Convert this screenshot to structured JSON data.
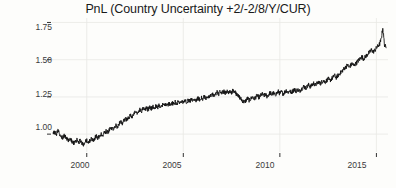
{
  "chart_data": {
    "type": "line",
    "title": "PnL (Country Uncertainty +2/-2/8/Y/CUR)",
    "xlabel": "",
    "ylabel": "",
    "xlim": [
      1998.2,
      2015.6
    ],
    "ylim": [
      0.88,
      1.78
    ],
    "xticks": [
      2000,
      2005,
      2010,
      2015
    ],
    "xticklabels": [
      "2000",
      "2005",
      "2010",
      "2015"
    ],
    "yticks": [
      1.0,
      1.25,
      1.5,
      1.75
    ],
    "yticklabels": [
      "1.00",
      "1.25",
      "1.50",
      "1.75"
    ],
    "grid": true,
    "grid_color": "#e8e8e4",
    "legend": false,
    "line_color": "#141414",
    "line_width": 0.9,
    "background": "#fdfdfb",
    "series": [
      {
        "name": "PnL",
        "x": [
          1998.25,
          1998.33,
          1998.42,
          1998.5,
          1998.58,
          1998.67,
          1998.75,
          1998.83,
          1998.92,
          1999.0,
          1999.08,
          1999.17,
          1999.25,
          1999.33,
          1999.42,
          1999.5,
          1999.58,
          1999.67,
          1999.75,
          1999.83,
          1999.92,
          2000.0,
          2000.08,
          2000.17,
          2000.25,
          2000.33,
          2000.42,
          2000.5,
          2000.58,
          2000.67,
          2000.75,
          2000.83,
          2000.92,
          2001.0,
          2001.08,
          2001.17,
          2001.25,
          2001.33,
          2001.42,
          2001.5,
          2001.58,
          2001.67,
          2001.75,
          2001.83,
          2001.92,
          2002.0,
          2002.08,
          2002.17,
          2002.25,
          2002.33,
          2002.42,
          2002.5,
          2002.58,
          2002.67,
          2002.75,
          2002.83,
          2002.92,
          2003.0,
          2003.08,
          2003.17,
          2003.25,
          2003.33,
          2003.42,
          2003.5,
          2003.58,
          2003.67,
          2003.75,
          2003.83,
          2003.92,
          2004.0,
          2004.08,
          2004.17,
          2004.25,
          2004.33,
          2004.42,
          2004.5,
          2004.58,
          2004.67,
          2004.75,
          2004.83,
          2004.92,
          2005.0,
          2005.08,
          2005.17,
          2005.25,
          2005.33,
          2005.42,
          2005.5,
          2005.58,
          2005.67,
          2005.75,
          2005.83,
          2005.92,
          2006.0,
          2006.08,
          2006.17,
          2006.25,
          2006.33,
          2006.42,
          2006.5,
          2006.58,
          2006.67,
          2006.75,
          2006.83,
          2006.92,
          2007.0,
          2007.08,
          2007.17,
          2007.25,
          2007.33,
          2007.42,
          2007.5,
          2007.58,
          2007.67,
          2007.75,
          2007.83,
          2007.92,
          2008.0,
          2008.08,
          2008.17,
          2008.25,
          2008.33,
          2008.42,
          2008.5,
          2008.58,
          2008.67,
          2008.75,
          2008.83,
          2008.92,
          2009.0,
          2009.08,
          2009.17,
          2009.25,
          2009.33,
          2009.42,
          2009.5,
          2009.58,
          2009.67,
          2009.75,
          2009.83,
          2009.92,
          2010.0,
          2010.08,
          2010.17,
          2010.25,
          2010.33,
          2010.42,
          2010.5,
          2010.58,
          2010.67,
          2010.75,
          2010.83,
          2010.92,
          2011.0,
          2011.08,
          2011.17,
          2011.25,
          2011.33,
          2011.42,
          2011.5,
          2011.58,
          2011.67,
          2011.75,
          2011.83,
          2011.92,
          2012.0,
          2012.08,
          2012.17,
          2012.25,
          2012.33,
          2012.42,
          2012.5,
          2012.58,
          2012.67,
          2012.75,
          2012.83,
          2012.92,
          2013.0,
          2013.08,
          2013.17,
          2013.25,
          2013.33,
          2013.42,
          2013.5,
          2013.58,
          2013.67,
          2013.75,
          2013.83,
          2013.92,
          2014.0,
          2014.08,
          2014.17,
          2014.25,
          2014.33,
          2014.42,
          2014.5,
          2014.58,
          2014.67,
          2014.75,
          2014.83,
          2014.92,
          2015.0,
          2015.08,
          2015.17,
          2015.25,
          2015.33,
          2015.42,
          2015.5
        ],
        "y": [
          1.0,
          1.012,
          0.997,
          1.021,
          1.006,
          0.985,
          0.972,
          0.991,
          0.978,
          0.963,
          0.952,
          0.968,
          0.95,
          0.938,
          0.949,
          0.962,
          0.945,
          0.958,
          0.941,
          0.932,
          0.946,
          0.958,
          0.944,
          0.956,
          0.969,
          0.958,
          0.973,
          0.986,
          0.972,
          0.988,
          1.003,
          0.992,
          1.008,
          1.021,
          1.01,
          1.026,
          1.041,
          1.03,
          1.048,
          1.062,
          1.05,
          1.068,
          1.082,
          1.071,
          1.089,
          1.104,
          1.092,
          1.11,
          1.126,
          1.114,
          1.131,
          1.146,
          1.134,
          1.151,
          1.166,
          1.155,
          1.172,
          1.16,
          1.176,
          1.164,
          1.18,
          1.169,
          1.186,
          1.174,
          1.19,
          1.178,
          1.194,
          1.183,
          1.199,
          1.188,
          1.203,
          1.192,
          1.207,
          1.196,
          1.211,
          1.2,
          1.215,
          1.204,
          1.219,
          1.208,
          1.222,
          1.212,
          1.226,
          1.216,
          1.23,
          1.22,
          1.234,
          1.224,
          1.238,
          1.228,
          1.242,
          1.232,
          1.246,
          1.236,
          1.25,
          1.24,
          1.254,
          1.244,
          1.258,
          1.268,
          1.256,
          1.272,
          1.281,
          1.27,
          1.285,
          1.274,
          1.288,
          1.276,
          1.29,
          1.278,
          1.292,
          1.28,
          1.294,
          1.282,
          1.27,
          1.258,
          1.246,
          1.234,
          1.222,
          1.214,
          1.228,
          1.24,
          1.226,
          1.238,
          1.25,
          1.236,
          1.248,
          1.26,
          1.246,
          1.258,
          1.27,
          1.256,
          1.268,
          1.254,
          1.266,
          1.278,
          1.264,
          1.276,
          1.262,
          1.274,
          1.286,
          1.272,
          1.284,
          1.27,
          1.282,
          1.294,
          1.28,
          1.292,
          1.278,
          1.29,
          1.302,
          1.288,
          1.3,
          1.286,
          1.298,
          1.31,
          1.322,
          1.308,
          1.32,
          1.332,
          1.318,
          1.33,
          1.342,
          1.328,
          1.34,
          1.352,
          1.338,
          1.35,
          1.362,
          1.348,
          1.36,
          1.372,
          1.358,
          1.37,
          1.382,
          1.394,
          1.38,
          1.392,
          1.404,
          1.416,
          1.428,
          1.44,
          1.452,
          1.464,
          1.45,
          1.462,
          1.474,
          1.46,
          1.472,
          1.484,
          1.496,
          1.508,
          1.52,
          1.506,
          1.518,
          1.53,
          1.542,
          1.554,
          1.566,
          1.552,
          1.564,
          1.578,
          1.592,
          1.606,
          1.64,
          1.71,
          1.6,
          1.58
        ]
      }
    ]
  },
  "axes": {
    "ytick_labels": [
      "1.75",
      "1.50",
      "1.25",
      "1.00"
    ],
    "xtick_labels": [
      "2000",
      "2005",
      "2010",
      "2015"
    ]
  }
}
